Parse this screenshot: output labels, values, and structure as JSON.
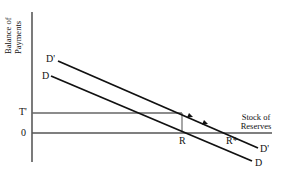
{
  "diagram": {
    "y_axis_label": [
      "Balance of",
      "Payments"
    ],
    "x_axis_label": [
      "Stock of",
      "Reserves"
    ],
    "origin_label": "0",
    "t_label": "T'",
    "curves": [
      {
        "id": "D_prime",
        "start_label": "D'",
        "end_label": "D'"
      },
      {
        "id": "D",
        "start_label": "D",
        "end_label": "D"
      }
    ],
    "points": {
      "r_label": "R",
      "r_star_label": "R*"
    },
    "colors": {
      "line": "#111111",
      "axis": "#333333",
      "gray_line": "#666666"
    }
  }
}
